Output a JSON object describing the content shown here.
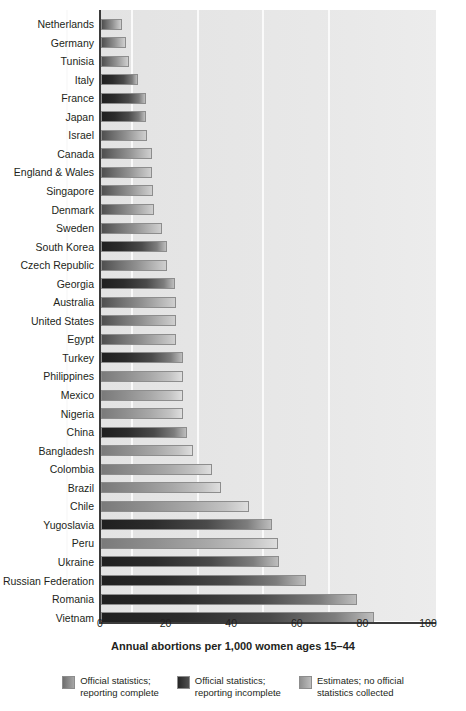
{
  "chart_data": {
    "type": "bar",
    "orientation": "horizontal",
    "title": "",
    "xlabel": "Annual abortions per 1,000 women ages 15–44",
    "ylabel": "",
    "xlim": [
      0,
      110
    ],
    "xticks": [
      0,
      20,
      40,
      60,
      80,
      100
    ],
    "xtick_labels": [
      "0",
      "20",
      "40",
      "60",
      "80",
      "100"
    ],
    "grid": true,
    "grid_axis": "x",
    "legend_position": "bottom",
    "categories": [
      "Netherlands",
      "Germany",
      "Tunisia",
      "Italy",
      "France",
      "Japan",
      "Israel",
      "Canada",
      "England & Wales",
      "Singapore",
      "Denmark",
      "Sweden",
      "South Korea",
      "Czech Republic",
      "Georgia",
      "Australia",
      "United States",
      "Egypt",
      "Turkey",
      "Philippines",
      "Mexico",
      "Nigeria",
      "China",
      "Bangladesh",
      "Colombia",
      "Brazil",
      "Chile",
      "Yugoslavia",
      "Peru",
      "Ukraine",
      "Russian Federation",
      "Romania",
      "Vietnam"
    ],
    "values": [
      6.5,
      7.6,
      8.6,
      11.4,
      13.8,
      13.8,
      14.0,
      15.5,
      15.6,
      16.0,
      16.1,
      18.7,
      20.0,
      20.0,
      22.6,
      22.8,
      22.9,
      23.0,
      25.0,
      25.0,
      25.1,
      25.0,
      26.1,
      28.0,
      33.7,
      36.5,
      45.0,
      52.0,
      54.0,
      54.2,
      62.6,
      78.0,
      83.3
    ],
    "series_of": [
      "complete",
      "complete",
      "complete",
      "incomplete",
      "incomplete",
      "incomplete",
      "complete",
      "complete",
      "complete",
      "complete",
      "complete",
      "complete",
      "incomplete",
      "complete",
      "incomplete",
      "complete",
      "complete",
      "complete",
      "incomplete",
      "estimate",
      "estimate",
      "estimate",
      "incomplete",
      "estimate",
      "estimate",
      "estimate",
      "estimate",
      "incomplete",
      "estimate",
      "incomplete",
      "incomplete",
      "incomplete",
      "incomplete"
    ],
    "legend": [
      {
        "key": "complete",
        "label": "Official statistics;\nreporting complete",
        "color": "#8a8a8a"
      },
      {
        "key": "incomplete",
        "label": "Official statistics;\nreporting incomplete",
        "color": "#333333"
      },
      {
        "key": "estimate",
        "label": "Estimates; no official\nstatistics collected",
        "color": "#a6a6a6"
      }
    ]
  }
}
